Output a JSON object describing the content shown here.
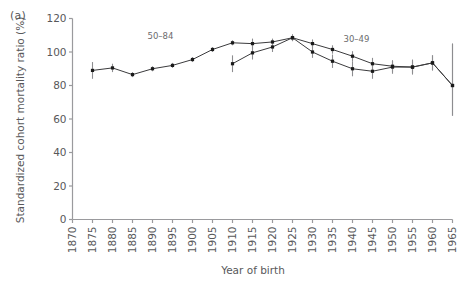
{
  "panel": {
    "tag": "(a)"
  },
  "chart_data": {
    "type": "line",
    "title": "",
    "xlabel": "Year of birth",
    "ylabel": "Standardized cohort mortality ratio (%)",
    "xlim": [
      1870,
      1965
    ],
    "ylim": [
      0,
      120
    ],
    "yticks": [
      0,
      20,
      40,
      60,
      80,
      100,
      120
    ],
    "xticks": [
      1870,
      1875,
      1880,
      1885,
      1890,
      1895,
      1900,
      1905,
      1910,
      1915,
      1920,
      1925,
      1930,
      1935,
      1940,
      1945,
      1950,
      1955,
      1960,
      1965
    ],
    "grid": false,
    "legend_position": "inline-annotations",
    "marker": "square",
    "errorbars": true,
    "line_color": "#3b3b3d",
    "marker_color": "#1a1a1a",
    "errorbar_color": "#8d8d90",
    "axis_color": "#9a9a9d",
    "series": [
      {
        "name": "50-84",
        "label": "50–84",
        "label_x": 1892,
        "label_y": 108,
        "x": [
          1875,
          1880,
          1885,
          1890,
          1895,
          1900,
          1905,
          1910,
          1915,
          1920,
          1925,
          1930,
          1935,
          1940,
          1945,
          1950,
          1955,
          1960,
          1965
        ],
        "values": [
          89.0,
          90.5,
          86.5,
          90.0,
          92.0,
          95.5,
          101.5,
          105.5,
          105.0,
          106.0,
          108.5,
          105.0,
          101.5,
          97.5,
          93.0,
          91.5,
          91.0,
          93.5,
          80.0
        ],
        "err_low": [
          84.0,
          88.0,
          85.0,
          88.5,
          90.5,
          94.0,
          100.0,
          104.0,
          102.0,
          104.0,
          106.5,
          102.5,
          99.0,
          94.5,
          89.5,
          88.0,
          87.5,
          89.0,
          62.0
        ],
        "err_high": [
          94.0,
          93.0,
          88.0,
          91.5,
          93.5,
          97.0,
          103.0,
          107.0,
          108.0,
          108.0,
          110.5,
          107.5,
          104.0,
          100.5,
          96.5,
          95.0,
          94.5,
          98.0,
          105.0
        ]
      },
      {
        "name": "30-49",
        "label": "30–49",
        "label_x": 1941,
        "label_y": 106,
        "x": [
          1910,
          1915,
          1920,
          1925,
          1930,
          1935,
          1940,
          1945,
          1950,
          1955,
          1960,
          1965
        ],
        "values": [
          93.0,
          99.5,
          103.0,
          108.5,
          100.0,
          94.5,
          90.0,
          88.5,
          91.0,
          91.0,
          93.5,
          80.0
        ],
        "err_low": [
          88.0,
          95.5,
          100.0,
          106.5,
          96.5,
          90.5,
          85.5,
          84.0,
          87.0,
          86.5,
          89.0,
          62.0
        ],
        "err_high": [
          98.0,
          103.5,
          106.0,
          110.5,
          103.5,
          98.5,
          94.5,
          93.0,
          95.0,
          95.5,
          98.0,
          105.0
        ]
      }
    ]
  }
}
